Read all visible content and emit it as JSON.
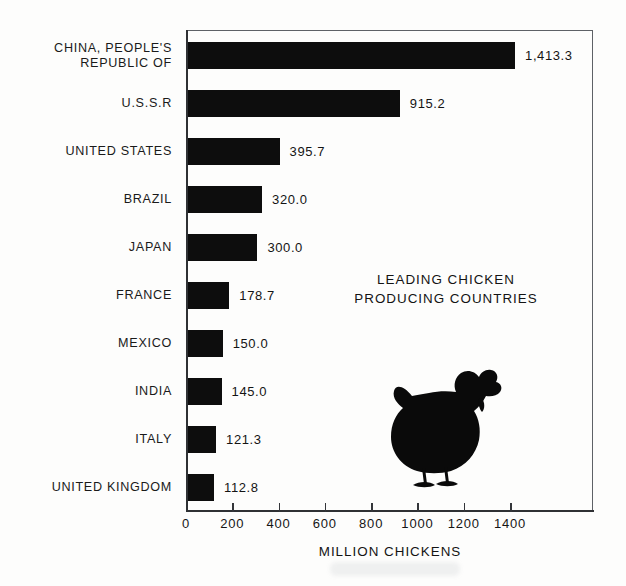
{
  "chart_data": {
    "type": "bar",
    "orientation": "horizontal",
    "title_lines": [
      "LEADING CHICKEN",
      "PRODUCING COUNTRIES"
    ],
    "xlabel": "MILLION CHICKENS",
    "ylabel": "",
    "xlim": [
      0,
      1750
    ],
    "xticks": [
      0,
      200,
      400,
      600,
      800,
      1000,
      1200,
      1400
    ],
    "xtick_labels": [
      "0",
      "200",
      "400",
      "600",
      "800",
      "1000",
      "1200",
      "1400"
    ],
    "grid": false,
    "legend": false,
    "bar_color": "#0d0d0d",
    "categories": [
      "CHINA, PEOPLE'S REPUBLIC OF",
      "U.S.S.R",
      "UNITED STATES",
      "BRAZIL",
      "JAPAN",
      "FRANCE",
      "MEXICO",
      "INDIA",
      "ITALY",
      "UNITED KINGDOM"
    ],
    "category_lines": [
      [
        "CHINA, PEOPLE'S",
        "REPUBLIC OF"
      ],
      [
        "U.S.S.R"
      ],
      [
        "UNITED STATES"
      ],
      [
        "BRAZIL"
      ],
      [
        "JAPAN"
      ],
      [
        "FRANCE"
      ],
      [
        "MEXICO"
      ],
      [
        "INDIA"
      ],
      [
        "ITALY"
      ],
      [
        "UNITED KINGDOM"
      ]
    ],
    "values": [
      1413.3,
      915.2,
      395.7,
      320.0,
      300.0,
      178.7,
      150.0,
      145.0,
      121.3,
      112.8
    ],
    "value_labels": [
      "1,413.3",
      "915.2",
      "395.7",
      "320.0",
      "300.0",
      "178.7",
      "150.0",
      "145.0",
      "121.3",
      "112.8"
    ]
  },
  "figure": {
    "illustration_name": "chicken-silhouette"
  }
}
